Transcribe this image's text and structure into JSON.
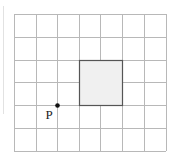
{
  "diagram": {
    "grid": {
      "columns": 7,
      "rows": 6,
      "x_lines": [
        14,
        36,
        57,
        79,
        100,
        122,
        144,
        166
      ],
      "y_lines": [
        14,
        37,
        60,
        82,
        105,
        128,
        151
      ],
      "line_color": "#b8b8b8"
    },
    "rectangle": {
      "col_start": 3,
      "col_end": 4,
      "row_start": 2,
      "row_end": 4,
      "fill": "#f0f0f0",
      "stroke": "#555555"
    },
    "point": {
      "label": "P",
      "grid_x": 2,
      "grid_y": 4,
      "color": "#111111"
    }
  }
}
